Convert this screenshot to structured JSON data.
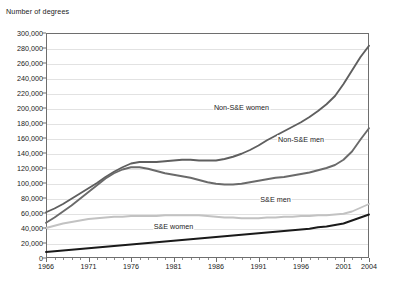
{
  "chart_data": {
    "type": "line",
    "title": "",
    "ylabel": "Number of degrees",
    "xlabel": "",
    "ylim": [
      0,
      300000
    ],
    "xlim": [
      1966,
      2004
    ],
    "grid": true,
    "legend_position": "inline-labels",
    "ytick_labels": [
      "300,000",
      "280,000",
      "260,000",
      "240,000",
      "220,000",
      "200,000",
      "180,000",
      "160,000",
      "140,000",
      "120,000",
      "100,000",
      "80,000",
      "60,000",
      "40,000",
      "20,000",
      "0"
    ],
    "ytick_values": [
      300000,
      280000,
      260000,
      240000,
      220000,
      200000,
      180000,
      160000,
      140000,
      120000,
      100000,
      80000,
      60000,
      40000,
      20000,
      0
    ],
    "xtick_labels": [
      "1966",
      "1971",
      "1976",
      "1981",
      "1986",
      "1991",
      "1996",
      "2001",
      "2004"
    ],
    "xtick_values": [
      1966,
      1971,
      1976,
      1981,
      1986,
      1991,
      1996,
      2001,
      2004
    ],
    "x": [
      1966,
      1967,
      1968,
      1969,
      1970,
      1971,
      1972,
      1973,
      1974,
      1975,
      1976,
      1977,
      1978,
      1979,
      1980,
      1981,
      1982,
      1983,
      1984,
      1985,
      1986,
      1987,
      1988,
      1989,
      1990,
      1991,
      1992,
      1993,
      1994,
      1995,
      1996,
      1997,
      1998,
      1999,
      2000,
      2001,
      2002,
      2003,
      2004
    ],
    "series": [
      {
        "name": "Non-S&E women",
        "color": "#5f5f5f",
        "values": [
          61000,
          66000,
          72000,
          79000,
          86000,
          93000,
          100000,
          108000,
          115000,
          121000,
          126000,
          128000,
          128000,
          128000,
          129000,
          130000,
          131000,
          131000,
          130000,
          130000,
          130000,
          132000,
          135000,
          139000,
          144000,
          150000,
          157000,
          163000,
          169000,
          175000,
          181000,
          188000,
          196000,
          205000,
          216000,
          232000,
          250000,
          268000,
          283000
        ]
      },
      {
        "name": "Non-S&E men",
        "color": "#6a6a6a",
        "values": [
          47000,
          54000,
          62000,
          70000,
          79000,
          88000,
          97000,
          106000,
          113000,
          118000,
          121000,
          121000,
          119000,
          116000,
          113000,
          111000,
          109000,
          107000,
          104000,
          101000,
          99000,
          98000,
          98000,
          99000,
          101000,
          103000,
          105000,
          107000,
          108000,
          110000,
          112000,
          114000,
          117000,
          120000,
          124000,
          131000,
          142000,
          158000,
          173000
        ]
      },
      {
        "name": "S&E men",
        "color": "#c2c2c2",
        "values": [
          40000,
          43000,
          46000,
          48000,
          50000,
          52000,
          53000,
          54000,
          55000,
          55000,
          56000,
          56000,
          56000,
          56000,
          57000,
          57000,
          57000,
          57000,
          57000,
          56000,
          55000,
          54000,
          54000,
          53000,
          53000,
          53000,
          54000,
          54000,
          55000,
          55000,
          56000,
          56000,
          57000,
          57000,
          58000,
          59000,
          62000,
          67000,
          72000
        ]
      },
      {
        "name": "S&E women",
        "color": "#1a1a1a",
        "values": [
          8000,
          9000,
          10000,
          11000,
          12000,
          13000,
          14000,
          15000,
          16000,
          17000,
          18000,
          19000,
          20000,
          21000,
          22000,
          23000,
          24000,
          25000,
          26000,
          27000,
          28000,
          29000,
          30000,
          31000,
          32000,
          33000,
          34000,
          35000,
          36000,
          37000,
          38000,
          39000,
          41000,
          42000,
          44000,
          46000,
          50000,
          54000,
          58000
        ]
      }
    ],
    "annotations": [
      {
        "text": "Non-S&E women",
        "x": 1989,
        "y": 200000
      },
      {
        "text": "Non-S&E men",
        "x": 1996,
        "y": 158000
      },
      {
        "text": "S&E men",
        "x": 1993,
        "y": 78000
      },
      {
        "text": "S&E women",
        "x": 1981,
        "y": 42000
      }
    ]
  }
}
